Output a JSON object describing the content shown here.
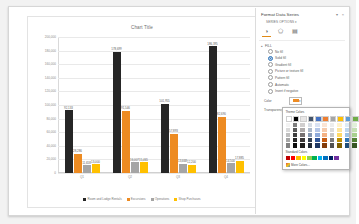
{
  "chart": {
    "title": "Chart Title",
    "chart_buttons": [
      {
        "name": "chart-elements-button",
        "glyph": "+"
      },
      {
        "name": "chart-styles-button",
        "glyph": "✎"
      },
      {
        "name": "chart-filters-button",
        "glyph": "⧨"
      }
    ]
  },
  "chart_data": {
    "type": "bar",
    "title": "Chart Title",
    "xlabel": "",
    "ylabel": "",
    "ylim": [
      0,
      200000
    ],
    "grid": true,
    "legend_position": "bottom",
    "ytick_labels": [
      "200,000",
      "180,000",
      "160,000",
      "140,000",
      "120,000",
      "100,000",
      "80,000",
      "60,000",
      "40,000",
      "20,000",
      "0"
    ],
    "ytick_values": [
      200000,
      180000,
      160000,
      140000,
      120000,
      100000,
      80000,
      60000,
      40000,
      20000,
      0
    ],
    "categories": [
      "Q1",
      "Q2",
      "Q3",
      "Q4"
    ],
    "series": [
      {
        "name": "Room and Lodge Rentals",
        "color": "#262626",
        "values": [
          92133,
          178699,
          101955,
          186395
        ]
      },
      {
        "name": "Excursions",
        "color": "#ED8B22",
        "values": [
          28286,
          91546,
          57893,
          82690
        ]
      },
      {
        "name": "Operations",
        "color": "#A5A5A5",
        "values": [
          11658,
          16007,
          13668,
          14500
        ]
      },
      {
        "name": "Shop Purchases",
        "color": "#FFC000",
        "values": [
          13000,
          15465,
          12200,
          17885
        ]
      }
    ],
    "data_labels": [
      [
        "92,133",
        "28,286",
        "11,658",
        "13,000"
      ],
      [
        "178,699",
        "91,546",
        "16,007",
        "15,465"
      ],
      [
        "101,955",
        "57,893",
        "13,668",
        "12,200"
      ],
      [
        "186,395",
        "82,690",
        "14,500",
        "17,885"
      ]
    ]
  },
  "pane": {
    "title": "Format Data Series",
    "subtitle": "SERIES OPTIONS",
    "subtitle_caret": "▾",
    "close_label": "×",
    "pin_label": "▾",
    "tabs": [
      {
        "name": "fill-line-tab",
        "glyph": "◑",
        "selected": true
      },
      {
        "name": "effects-tab",
        "glyph": "⬠",
        "selected": false
      },
      {
        "name": "series-options-tab",
        "glyph": "▤",
        "selected": false
      }
    ],
    "section": {
      "header": "FILL",
      "caret": "▴",
      "options": [
        {
          "label": "No fill",
          "selected": false
        },
        {
          "label": "Solid fill",
          "selected": true
        },
        {
          "label": "Gradient fill",
          "selected": false
        },
        {
          "label": "Picture or texture fill",
          "selected": false
        },
        {
          "label": "Pattern fill",
          "selected": false
        },
        {
          "label": "Automatic",
          "selected": false
        },
        {
          "label": "Invert if negative",
          "selected": false
        }
      ],
      "fields": [
        {
          "label": "Color",
          "name": "fill-color-field",
          "swatch": "#ED8B22"
        },
        {
          "label": "Transparency",
          "name": "fill-transparency-field",
          "value": "0%"
        }
      ]
    }
  },
  "color_dropdown": {
    "theme_header": "Theme Colors",
    "standard_header": "Standard Colors",
    "more_label": "More Colors...",
    "theme_top": [
      "#FFFFFF",
      "#000000",
      "#E7E6E6",
      "#44546A",
      "#4472C4",
      "#ED7D31",
      "#A5A5A5",
      "#FFC000",
      "#5B9BD5",
      "#70AD47"
    ],
    "theme_shades": [
      [
        "#F2F2F2",
        "#D9D9D9",
        "#BFBFBF",
        "#A6A6A6",
        "#808080"
      ],
      [
        "#7F7F7F",
        "#595959",
        "#404040",
        "#262626",
        "#0D0D0D"
      ],
      [
        "#D0CECE",
        "#AFABAB",
        "#767171",
        "#3B3838",
        "#201F1E"
      ],
      [
        "#D6DCE4",
        "#ACB9CA",
        "#8496B0",
        "#333F4F",
        "#222A35"
      ],
      [
        "#D9E2F3",
        "#B4C6E7",
        "#8EAADB",
        "#2F5597",
        "#1F3864"
      ],
      [
        "#FBE5D5",
        "#F7CBAC",
        "#F4B183",
        "#C55A11",
        "#833C0B"
      ],
      [
        "#EDEDED",
        "#DBDBDB",
        "#C9C9C9",
        "#7B7B7B",
        "#525252"
      ],
      [
        "#FFF2CC",
        "#FFE599",
        "#FFD965",
        "#BF8F00",
        "#7F6000"
      ],
      [
        "#DDEBF6",
        "#BDD7EE",
        "#9DC3E6",
        "#2E75B5",
        "#1F4E79"
      ],
      [
        "#E2EFD9",
        "#C5E0B3",
        "#A8D08D",
        "#538135",
        "#375623"
      ]
    ],
    "standard": [
      "#C00000",
      "#FF0000",
      "#FFC000",
      "#FFFF00",
      "#92D050",
      "#00B050",
      "#00B0F0",
      "#0070C0",
      "#002060",
      "#7030A0"
    ]
  }
}
